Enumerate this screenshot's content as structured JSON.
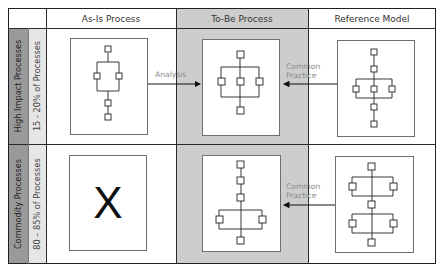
{
  "headers": {
    "as_is": "As-Is Process",
    "to_be": "To-Be Process",
    "reference": "Reference Model"
  },
  "rows": [
    {
      "category": "High Impact Processes",
      "share": "15 - 20% of Processes",
      "as_is_symbol": "",
      "arrow_left_label": "Analysis",
      "arrow_right_label_line1": "Common",
      "arrow_right_label_line2": "Practice"
    },
    {
      "category": "Commodity Processes",
      "share": "80 – 85% of Processes",
      "as_is_symbol": "X",
      "arrow_right_label_line1": "Common",
      "arrow_right_label_line2": "Practice"
    }
  ],
  "colors": {
    "to_be_column_bg": "#cdcdcd",
    "category_label_bg": "#9a9a9a",
    "share_label_bg": "#e6e6e6",
    "grid_line": "#2a2a2a",
    "annotation_text": "#8a8a8a"
  }
}
